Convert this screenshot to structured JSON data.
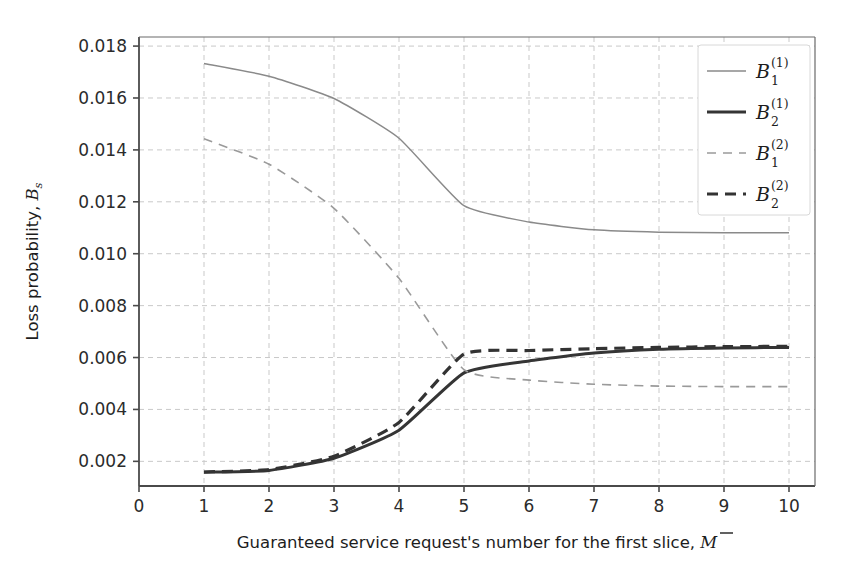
{
  "chart_data": {
    "type": "line",
    "title": "",
    "xlabel": "Guaranteed service request's number for the first slice, M̅",
    "ylabel": "Loss probability, Bₛ",
    "xlim": [
      0,
      10.4
    ],
    "ylim": [
      0.00105,
      0.01835
    ],
    "xticks": [
      "0",
      "1",
      "2",
      "3",
      "4",
      "5",
      "6",
      "7",
      "8",
      "9",
      "10"
    ],
    "xtick_values": [
      0,
      1,
      2,
      3,
      4,
      5,
      6,
      7,
      8,
      9,
      10
    ],
    "yticks": [
      "0.002",
      "0.004",
      "0.006",
      "0.008",
      "0.010",
      "0.012",
      "0.014",
      "0.016",
      "0.018"
    ],
    "ytick_values": [
      0.002,
      0.004,
      0.006,
      0.008,
      0.01,
      0.012,
      0.014,
      0.016,
      0.018
    ],
    "grid": true,
    "grid_style": "dashed",
    "grid_color": "#c9c9c9",
    "legend_position": "upper right",
    "x": [
      1,
      2,
      3,
      4,
      5,
      6,
      7,
      8,
      9,
      10
    ],
    "series": [
      {
        "name": "B_1^(1)",
        "label_base": "B",
        "label_sub": "1",
        "label_sup": "(1)",
        "style": "solid",
        "color": "#8a8a8a",
        "width": 1.5,
        "values": [
          0.01733,
          0.01684,
          0.01598,
          0.01445,
          0.01185,
          0.01122,
          0.01092,
          0.01083,
          0.01081,
          0.01081
        ]
      },
      {
        "name": "B_2^(1)",
        "label_base": "B",
        "label_sub": "2",
        "label_sup": "(1)",
        "style": "solid",
        "color": "#353535",
        "width": 3.0,
        "values": [
          0.00158,
          0.00165,
          0.00212,
          0.0032,
          0.00541,
          0.00587,
          0.00617,
          0.00632,
          0.00637,
          0.00639
        ]
      },
      {
        "name": "B_1^(2)",
        "label_base": "B",
        "label_sub": "1",
        "label_sup": "(2)",
        "style": "dashed",
        "color": "#9a9a9a",
        "width": 1.6,
        "values": [
          0.01443,
          0.01345,
          0.01175,
          0.00905,
          0.00553,
          0.00513,
          0.00497,
          0.0049,
          0.00488,
          0.00488
        ]
      },
      {
        "name": "B_2^(2)",
        "label_base": "B",
        "label_sub": "2",
        "label_sup": "(2)",
        "style": "dashed",
        "color": "#333333",
        "width": 3.2,
        "values": [
          0.00159,
          0.00168,
          0.0022,
          0.0035,
          0.00613,
          0.00627,
          0.00634,
          0.00639,
          0.00642,
          0.00643
        ]
      }
    ]
  },
  "axes": {
    "x_axis_label": "Guaranteed service request's number for the first slice,",
    "x_axis_symbol": "M",
    "y_axis_label": "Loss probability,",
    "y_axis_symbol": "B",
    "y_axis_symbol_sub": "s"
  }
}
